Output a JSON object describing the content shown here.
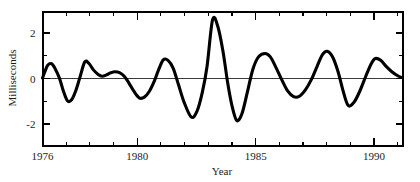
{
  "chart_data": {
    "type": "line",
    "title": "",
    "subtitle": "",
    "xlabel": "Year",
    "ylabel": "Milliseconds",
    "xlim": [
      1976,
      1991.2
    ],
    "ylim": [
      -2.95,
      2.95
    ],
    "grid": false,
    "legend": null,
    "zero_reference_line": 0,
    "x_major_ticks": [
      1976,
      1980,
      1985,
      1990
    ],
    "x_major_tick_labels": [
      "1976",
      "1980",
      "1985",
      "1990"
    ],
    "x_minor_ticks": [
      1977,
      1978,
      1979,
      1981,
      1982,
      1983,
      1984,
      1986,
      1987,
      1988,
      1989,
      1991
    ],
    "y_major_ticks": [
      -2,
      0,
      2
    ],
    "y_major_tick_labels": [
      "-2",
      "0",
      "2"
    ],
    "y_minor_ticks": [
      -1,
      1
    ],
    "series": [
      {
        "name": "Length-of-day variation",
        "color": "#000000",
        "line_width": 3,
        "x": [
          1976.0,
          1976.1,
          1976.22,
          1976.38,
          1976.55,
          1976.72,
          1976.88,
          1977.05,
          1977.22,
          1977.4,
          1977.58,
          1977.78,
          1977.95,
          1978.15,
          1978.35,
          1978.52,
          1978.7,
          1978.88,
          1979.05,
          1979.25,
          1979.45,
          1979.65,
          1979.85,
          1980.08,
          1980.3,
          1980.52,
          1980.72,
          1980.9,
          1981.1,
          1981.3,
          1981.52,
          1981.75,
          1981.98,
          1982.28,
          1982.52,
          1982.75,
          1982.95,
          1983.18,
          1983.4,
          1983.62,
          1983.82,
          1984.0,
          1984.2,
          1984.42,
          1984.65,
          1984.88,
          1985.12,
          1985.4,
          1985.62,
          1985.85,
          1986.1,
          1986.35,
          1986.6,
          1986.85,
          1987.1,
          1987.35,
          1987.6,
          1987.82,
          1988.02,
          1988.25,
          1988.48,
          1988.68,
          1988.9,
          1989.15,
          1989.4,
          1989.65,
          1989.88,
          1990.05,
          1990.28,
          1990.52,
          1990.75,
          1991.0,
          1991.15
        ],
        "y": [
          0.02,
          0.3,
          0.58,
          0.65,
          0.4,
          0.0,
          -0.55,
          -0.98,
          -0.95,
          -0.55,
          0.05,
          0.72,
          0.68,
          0.38,
          0.18,
          0.1,
          0.16,
          0.25,
          0.3,
          0.26,
          0.1,
          -0.2,
          -0.55,
          -0.85,
          -0.82,
          -0.55,
          -0.12,
          0.38,
          0.82,
          0.8,
          0.45,
          -0.3,
          -1.05,
          -1.7,
          -1.45,
          -0.6,
          0.55,
          2.58,
          2.3,
          1.2,
          -0.2,
          -1.2,
          -1.85,
          -1.55,
          -0.6,
          0.4,
          0.95,
          1.1,
          0.95,
          0.5,
          -0.05,
          -0.55,
          -0.8,
          -0.78,
          -0.5,
          -0.05,
          0.55,
          1.05,
          1.2,
          0.95,
          0.3,
          -0.5,
          -1.18,
          -1.05,
          -0.55,
          0.1,
          0.65,
          0.88,
          0.8,
          0.52,
          0.3,
          0.12,
          0.05
        ]
      }
    ],
    "annotations": []
  },
  "axes": {
    "x_axis_title": "Year",
    "y_axis_title": "Milliseconds"
  }
}
